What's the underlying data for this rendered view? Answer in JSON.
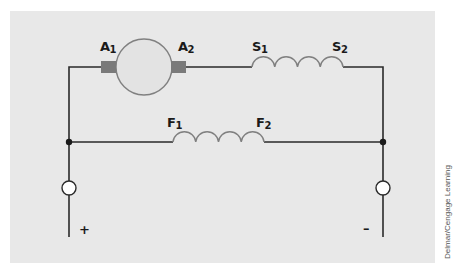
{
  "diagram": {
    "type": "compound DC motor circuit (shunt + series field)",
    "colors": {
      "background": "#e8e8e8",
      "wire": "#2a2a2a",
      "coil": "#808080",
      "armature_outline": "#808080",
      "armature_fill": "#e3e3e3",
      "brush": "#7a7a7a"
    },
    "armature": {
      "label_left": {
        "main": "A",
        "sub": "1"
      },
      "label_right": {
        "main": "A",
        "sub": "2"
      }
    },
    "series_field": {
      "label_left": {
        "main": "S",
        "sub": "1"
      },
      "label_right": {
        "main": "S",
        "sub": "2"
      },
      "loops": 4
    },
    "shunt_field": {
      "label_left": {
        "main": "F",
        "sub": "1"
      },
      "label_right": {
        "main": "F",
        "sub": "2"
      },
      "loops": 4
    },
    "terminals": {
      "positive": "+",
      "negative": "–"
    }
  },
  "credit": "Delmar/Cengage Learning"
}
